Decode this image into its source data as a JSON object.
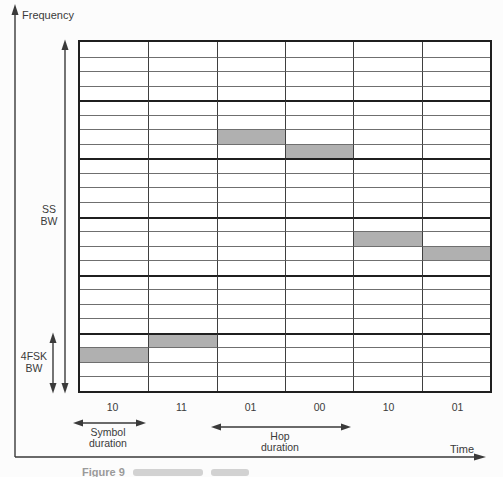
{
  "figure": {
    "frequency_axis_label": "Frequency",
    "time_axis_label": "Time",
    "ss_bw_label_lines": [
      "SS",
      "BW"
    ],
    "fsk_bw_label_lines": [
      "4FSK",
      "BW"
    ],
    "symbol_duration_label_lines": [
      "Symbol",
      "duration"
    ],
    "hop_duration_label_lines": [
      "Hop",
      "duration"
    ],
    "caption_fragment": "Figure 9"
  },
  "chart_data": {
    "type": "heatmap",
    "xlabel": "Time",
    "ylabel": "Frequency",
    "x_categories_symbols": [
      "10",
      "11",
      "01",
      "00",
      "10",
      "01"
    ],
    "n_time_slots": 6,
    "n_frequency_rows": 24,
    "rows_per_hop_channel": 4,
    "n_hop_channels": 6,
    "symbol_to_tone_offset_from_channel_bottom": {
      "00": 0,
      "01": 1,
      "10": 2,
      "11": 3
    },
    "occupied_cells": [
      {
        "time_slot": 0,
        "symbol": "10",
        "row_from_top": 21,
        "hop_channel_from_bottom": 0
      },
      {
        "time_slot": 1,
        "symbol": "11",
        "row_from_top": 20,
        "hop_channel_from_bottom": 0
      },
      {
        "time_slot": 2,
        "symbol": "01",
        "row_from_top": 6,
        "hop_channel_from_bottom": 4
      },
      {
        "time_slot": 3,
        "symbol": "00",
        "row_from_top": 7,
        "hop_channel_from_bottom": 4
      },
      {
        "time_slot": 4,
        "symbol": "10",
        "row_from_top": 13,
        "hop_channel_from_bottom": 2
      },
      {
        "time_slot": 5,
        "symbol": "01",
        "row_from_top": 14,
        "hop_channel_from_bottom": 2
      }
    ],
    "annotations": [
      "SS BW",
      "4FSK BW",
      "Symbol duration",
      "Hop duration"
    ],
    "shade_color": "#b0b0b0",
    "row_line_color": "#6f6f6f",
    "column_line_color": "#3f3f3f",
    "channel_line_color": "#1f1f1f",
    "grid": true,
    "legend": "none"
  }
}
